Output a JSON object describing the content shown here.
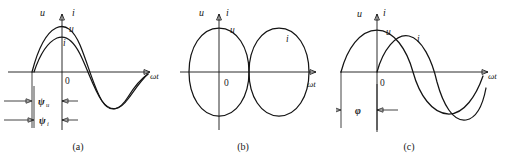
{
  "figure": {
    "background": "#ffffff",
    "stroke_color": "#141414",
    "width": 506,
    "height": 158
  },
  "labels": {
    "u": "u",
    "i": "i",
    "zero": "0",
    "omega_t": "ωt",
    "psi_u": "ψ",
    "psi_u_sub": "u",
    "psi_i": "ψ",
    "psi_i_sub": "i",
    "phi": "φ"
  },
  "panels": [
    {
      "id": "a",
      "caption": "(a)",
      "axis_y_labels": [
        "u",
        "i"
      ],
      "x_axis_label": "ωt",
      "origin_label": "0",
      "curves": [
        {
          "name": "u",
          "label": "u",
          "amplitude": 45,
          "phase_deg": 28,
          "note": "voltage leads, larger amplitude"
        },
        {
          "name": "i",
          "label": "i",
          "amplitude": 33,
          "phase_deg": 24,
          "note": "current, smaller amplitude"
        }
      ],
      "dimensions": [
        {
          "name": "psi_u",
          "label": "ψ",
          "sub": "u",
          "meaning": "initial phase angle of voltage"
        },
        {
          "name": "psi_i",
          "label": "ψ",
          "sub": "i",
          "meaning": "initial phase angle of current"
        }
      ]
    },
    {
      "id": "b",
      "caption": "(b)",
      "axis_y_labels": [
        "u",
        "i"
      ],
      "x_axis_label": "ωt",
      "origin_label": "0",
      "curves": [
        {
          "name": "u",
          "label": "u",
          "amplitude": 45,
          "phase_deg": 90,
          "note": "voltage, peak at origin"
        },
        {
          "name": "i",
          "label": "i",
          "amplitude": 45,
          "phase_deg": -90,
          "note": "current, anti-phase 180 degrees"
        }
      ],
      "dimensions": []
    },
    {
      "id": "c",
      "caption": "(c)",
      "axis_y_labels": [
        "u",
        "i"
      ],
      "x_axis_label": "ωt",
      "origin_label": "0",
      "curves": [
        {
          "name": "u",
          "label": "u",
          "amplitude": 45,
          "phase_deg": 72,
          "note": "voltage leads current"
        },
        {
          "name": "i",
          "label": "i",
          "amplitude": 45,
          "phase_deg": 12,
          "note": "current lags voltage by phi"
        }
      ],
      "dimensions": [
        {
          "name": "phi",
          "label": "φ",
          "sub": "",
          "meaning": "phase difference between u and i"
        }
      ]
    }
  ]
}
